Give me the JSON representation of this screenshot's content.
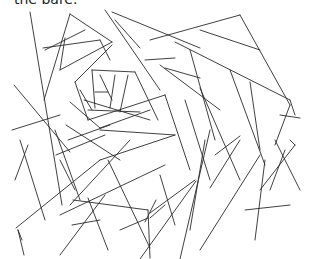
{
  "caption": {
    "text": "the bare."
  },
  "figure": {
    "stroke_color": "#2a2a2a",
    "background": "#ffffff"
  }
}
